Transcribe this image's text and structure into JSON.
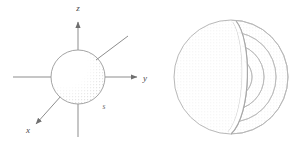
{
  "figure": {
    "background_color": "#ffffff",
    "line_color": "#8d8d8d",
    "label_color": "#4a4a4a",
    "stipple_color": "#b4b4b4",
    "width": 306,
    "height": 151,
    "panels": [
      {
        "id": "left-panel",
        "name": "coordinate-axes-sphere",
        "description": "Shaded sphere centered at the origin of an x-y-z coordinate frame",
        "axes": [
          {
            "name": "z-axis",
            "label": "z",
            "label_x": 78,
            "label_y": 11,
            "direction": "up",
            "arrow": true
          },
          {
            "name": "y-axis",
            "label": "y",
            "label_x": 145,
            "label_y": 81,
            "direction": "right",
            "arrow": true
          },
          {
            "name": "x-axis",
            "label": "x",
            "label_x": 28,
            "label_y": 133,
            "direction": "down-left",
            "arrow": true
          }
        ],
        "annotations": [
          {
            "name": "s-label",
            "label": "s",
            "label_x": 104,
            "label_y": 108
          }
        ],
        "sphere": {
          "center_x": 78,
          "center_y": 77,
          "radius": 27,
          "shading": "stippled-lower-right"
        },
        "leader_line": {
          "name": "radius-pointer",
          "from_x": 98,
          "from_y": 58,
          "to_x": 128,
          "to_y": 36
        }
      },
      {
        "id": "right-panel",
        "name": "cutaway-shell-sphere",
        "description": "Sphere with a wedge cut away exposing nested concentric shells",
        "sphere": {
          "center_x": 231,
          "center_y": 77,
          "radius": 57
        },
        "shells": [
          {
            "name": "shell-1",
            "radius": 57
          },
          {
            "name": "shell-2",
            "radius": 45
          },
          {
            "name": "shell-3",
            "radius": 33
          },
          {
            "name": "shell-4",
            "radius": 21
          },
          {
            "name": "shell-5",
            "radius": 11
          }
        ],
        "cutaway": {
          "name": "cutaway-wedge",
          "top_x": 236,
          "top_y": 21,
          "bottom_x": 231,
          "bottom_y": 134,
          "bulge": 18
        }
      }
    ]
  }
}
